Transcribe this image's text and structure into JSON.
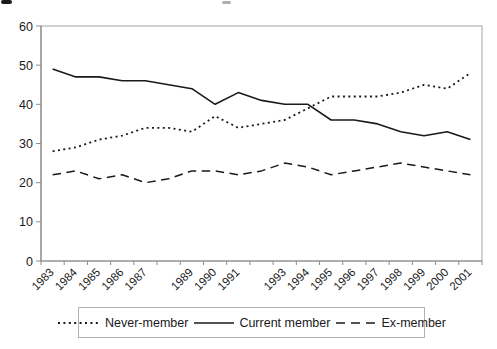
{
  "page": {
    "background": "#ffffff",
    "artifacts": {
      "top_left": "partial-character-mark",
      "top_center": "faint-partial-character-mark"
    }
  },
  "colors": {
    "plot_border": "#a3a3a3",
    "axis": "#8c8c8c",
    "tick": "#8c8c8c",
    "text": "#1a1a1a",
    "series_line": "#1a1a1a",
    "legend_border": "#b2b2b2"
  },
  "chart_data": {
    "type": "line",
    "title": "",
    "xlabel": "",
    "ylabel": "",
    "grid": false,
    "legend_position": "bottom",
    "ylim": [
      0,
      60
    ],
    "y_ticks": [
      0,
      10,
      20,
      30,
      40,
      50,
      60
    ],
    "x": [
      1983,
      1984,
      1985,
      1986,
      1987,
      1988,
      1989,
      1990,
      1991,
      1992,
      1993,
      1994,
      1995,
      1996,
      1997,
      1998,
      1999,
      2000,
      2001
    ],
    "x_tick_labels": [
      "1983",
      "1984",
      "1985",
      "1986",
      "1987",
      "",
      "1989",
      "1990",
      "1991",
      "",
      "1993",
      "1994",
      "1995",
      "1996",
      "1997",
      "1998",
      "1999",
      "2000",
      "2001"
    ],
    "series": [
      {
        "name": "Never-member",
        "line_style": "dotted",
        "color": "#1a1a1a",
        "values": [
          28,
          29,
          31,
          32,
          34,
          34,
          33,
          37,
          34,
          35,
          36,
          39,
          42,
          42,
          42,
          43,
          45,
          44,
          48
        ]
      },
      {
        "name": "Current member",
        "line_style": "solid",
        "color": "#1a1a1a",
        "values": [
          49,
          47,
          47,
          46,
          46,
          45,
          44,
          40,
          43,
          41,
          40,
          40,
          36,
          36,
          35,
          33,
          32,
          33,
          31
        ]
      },
      {
        "name": "Ex-member",
        "line_style": "dashed",
        "color": "#1a1a1a",
        "values": [
          22,
          23,
          21,
          22,
          20,
          21,
          23,
          23,
          22,
          23,
          25,
          24,
          22,
          23,
          24,
          25,
          24,
          23,
          22
        ]
      }
    ]
  }
}
